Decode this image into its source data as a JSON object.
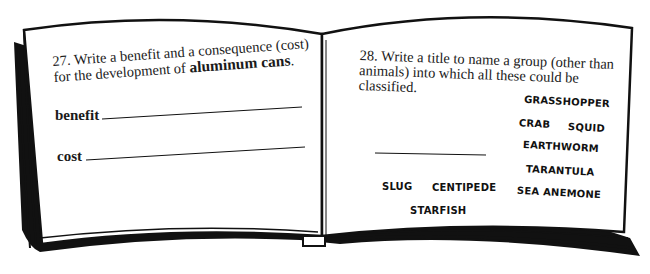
{
  "left_page": {
    "question": {
      "number": "27.",
      "text_line1": "Write a benefit and a consequence (cost)",
      "text_line2_prefix": "for the development of ",
      "text_line2_bold": "aluminum cans",
      "text_line2_suffix": "."
    },
    "fields": {
      "benefit_label": "benefit",
      "cost_label": "cost"
    }
  },
  "right_page": {
    "question": {
      "number": "28.",
      "text_line1": "Write a title to name a group (other than",
      "text_line2": "animals) into which all these could be",
      "text_line3": "classified."
    },
    "words": [
      "GRASSHOPPER",
      "CRAB",
      "SQUID",
      "EARTHWORM",
      "TARANTULA",
      "SLUG",
      "CENTIPEDE",
      "SEA ANEMONE",
      "STARFISH"
    ]
  }
}
